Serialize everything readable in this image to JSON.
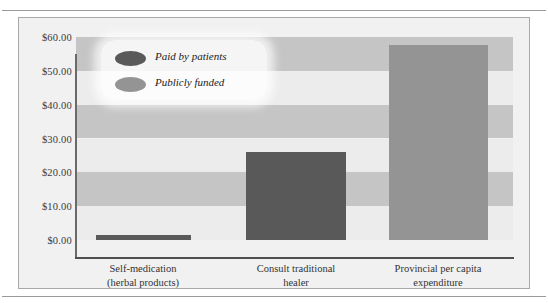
{
  "title": "",
  "legend": {
    "position": "top-left",
    "items": [
      {
        "label": "Paid by patients",
        "color": "#595959",
        "swatch": "ellipse-swatch"
      },
      {
        "label": "Publicly funded",
        "color": "#949494",
        "swatch": "ellipse-swatch"
      }
    ]
  },
  "axis": {
    "y_ticks": [
      "$60.00",
      "$50.00",
      "$40.00",
      "$30.00",
      "$20.00",
      "$10.00",
      "$0.00"
    ]
  },
  "categories": [
    {
      "line1": "Self-medication",
      "line2": "(herbal products)"
    },
    {
      "line1": "Consult traditional",
      "line2": "healer"
    },
    {
      "line1": "Provincial per capita",
      "line2": "expenditure"
    }
  ],
  "colors": {
    "paid_by_patients": "#595959",
    "publicly_funded": "#949494",
    "band_light": "#ececec",
    "band_dark": "#c5c5c5",
    "panel": "#f1f1f1",
    "frame_border": "#a8a8a8",
    "axis": "#4f4f4f"
  },
  "chart_data": {
    "type": "bar",
    "title": "",
    "xlabel": "",
    "ylabel": "",
    "ylim": [
      0,
      60
    ],
    "ytick_values": [
      0,
      10,
      20,
      30,
      40,
      50,
      60
    ],
    "ytick_format": "$0.00",
    "grid": "horizontal-alternating-bands",
    "legend_position": "top-left",
    "categories": [
      "Self-medication (herbal products)",
      "Consult traditional healer",
      "Provincial per capita expenditure"
    ],
    "series": [
      {
        "name": "Paid by patients",
        "color": "#595959",
        "values": [
          1.5,
          26.0,
          null
        ]
      },
      {
        "name": "Publicly funded",
        "color": "#949494",
        "values": [
          null,
          null,
          57.5
        ]
      }
    ],
    "bars": [
      {
        "category": "Self-medication (herbal products)",
        "series": "Paid by patients",
        "value": 1.5,
        "color": "#595959"
      },
      {
        "category": "Consult traditional healer",
        "series": "Paid by patients",
        "value": 26.0,
        "color": "#595959"
      },
      {
        "category": "Provincial per capita expenditure",
        "series": "Publicly funded",
        "value": 57.5,
        "color": "#949494"
      }
    ]
  }
}
